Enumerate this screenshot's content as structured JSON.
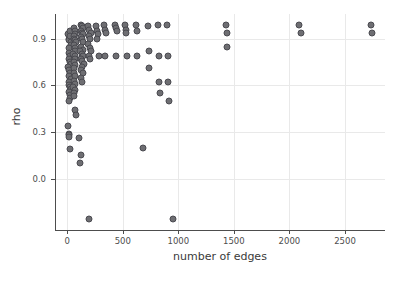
{
  "chart_data": {
    "type": "scatter",
    "title": "",
    "xlabel": "number of edges",
    "ylabel": "rho",
    "xlim": [
      -110,
      2860
    ],
    "ylim": [
      -0.33,
      1.06
    ],
    "xticks": [
      0,
      500,
      1000,
      1500,
      2000,
      2500
    ],
    "xticklabels": [
      "0",
      "500",
      "1000",
      "1500",
      "2000",
      "2500"
    ],
    "yticks": [
      0.0,
      0.3,
      0.6,
      0.9
    ],
    "yticklabels": [
      "0.0",
      "0.3",
      "0.6",
      "0.9"
    ],
    "grid": true,
    "legend": null,
    "marker": {
      "shape": "circle",
      "fill_color": "#6e6e72",
      "edge_color": "#4a4a50",
      "size_px": 7
    },
    "points": [
      {
        "x": 8,
        "y": 0.93
      },
      {
        "x": 12,
        "y": 0.9
      },
      {
        "x": 18,
        "y": 0.89
      },
      {
        "x": 22,
        "y": 0.95
      },
      {
        "x": 26,
        "y": 0.92
      },
      {
        "x": 30,
        "y": 0.88
      },
      {
        "x": 34,
        "y": 0.86
      },
      {
        "x": 16,
        "y": 0.84
      },
      {
        "x": 20,
        "y": 0.81
      },
      {
        "x": 28,
        "y": 0.79
      },
      {
        "x": 14,
        "y": 0.77
      },
      {
        "x": 24,
        "y": 0.75
      },
      {
        "x": 32,
        "y": 0.74
      },
      {
        "x": 10,
        "y": 0.72
      },
      {
        "x": 18,
        "y": 0.7
      },
      {
        "x": 26,
        "y": 0.68
      },
      {
        "x": 12,
        "y": 0.66
      },
      {
        "x": 30,
        "y": 0.64
      },
      {
        "x": 20,
        "y": 0.62
      },
      {
        "x": 14,
        "y": 0.6
      },
      {
        "x": 24,
        "y": 0.59
      },
      {
        "x": 34,
        "y": 0.58
      },
      {
        "x": 18,
        "y": 0.56
      },
      {
        "x": 28,
        "y": 0.54
      },
      {
        "x": 22,
        "y": 0.52
      },
      {
        "x": 16,
        "y": 0.5
      },
      {
        "x": 10,
        "y": 0.34
      },
      {
        "x": 14,
        "y": 0.29
      },
      {
        "x": 18,
        "y": 0.28
      },
      {
        "x": 20,
        "y": 0.27
      },
      {
        "x": 24,
        "y": 0.19
      },
      {
        "x": 60,
        "y": 0.97
      },
      {
        "x": 66,
        "y": 0.95
      },
      {
        "x": 72,
        "y": 0.93
      },
      {
        "x": 58,
        "y": 0.92
      },
      {
        "x": 64,
        "y": 0.9
      },
      {
        "x": 70,
        "y": 0.89
      },
      {
        "x": 76,
        "y": 0.88
      },
      {
        "x": 62,
        "y": 0.86
      },
      {
        "x": 68,
        "y": 0.84
      },
      {
        "x": 74,
        "y": 0.82
      },
      {
        "x": 56,
        "y": 0.8
      },
      {
        "x": 66,
        "y": 0.79
      },
      {
        "x": 72,
        "y": 0.77
      },
      {
        "x": 60,
        "y": 0.75
      },
      {
        "x": 70,
        "y": 0.73
      },
      {
        "x": 64,
        "y": 0.71
      },
      {
        "x": 58,
        "y": 0.68
      },
      {
        "x": 74,
        "y": 0.66
      },
      {
        "x": 62,
        "y": 0.63
      },
      {
        "x": 68,
        "y": 0.61
      },
      {
        "x": 56,
        "y": 0.59
      },
      {
        "x": 72,
        "y": 0.57
      },
      {
        "x": 64,
        "y": 0.55
      },
      {
        "x": 60,
        "y": 0.53
      },
      {
        "x": 70,
        "y": 0.44
      },
      {
        "x": 78,
        "y": 0.41
      },
      {
        "x": 120,
        "y": 0.99
      },
      {
        "x": 130,
        "y": 0.98
      },
      {
        "x": 140,
        "y": 0.97
      },
      {
        "x": 126,
        "y": 0.95
      },
      {
        "x": 136,
        "y": 0.94
      },
      {
        "x": 146,
        "y": 0.93
      },
      {
        "x": 122,
        "y": 0.91
      },
      {
        "x": 134,
        "y": 0.9
      },
      {
        "x": 144,
        "y": 0.88
      },
      {
        "x": 128,
        "y": 0.85
      },
      {
        "x": 138,
        "y": 0.83
      },
      {
        "x": 118,
        "y": 0.82
      },
      {
        "x": 132,
        "y": 0.8
      },
      {
        "x": 142,
        "y": 0.79
      },
      {
        "x": 124,
        "y": 0.77
      },
      {
        "x": 136,
        "y": 0.76
      },
      {
        "x": 148,
        "y": 0.74
      },
      {
        "x": 130,
        "y": 0.72
      },
      {
        "x": 120,
        "y": 0.7
      },
      {
        "x": 140,
        "y": 0.68
      },
      {
        "x": 126,
        "y": 0.65
      },
      {
        "x": 134,
        "y": 0.62
      },
      {
        "x": 190,
        "y": 0.98
      },
      {
        "x": 200,
        "y": 0.96
      },
      {
        "x": 210,
        "y": 0.94
      },
      {
        "x": 196,
        "y": 0.92
      },
      {
        "x": 206,
        "y": 0.9
      },
      {
        "x": 186,
        "y": 0.87
      },
      {
        "x": 202,
        "y": 0.84
      },
      {
        "x": 212,
        "y": 0.82
      },
      {
        "x": 192,
        "y": 0.79
      },
      {
        "x": 208,
        "y": 0.77
      },
      {
        "x": 110,
        "y": 0.26
      },
      {
        "x": 120,
        "y": 0.15
      },
      {
        "x": 116,
        "y": 0.1
      },
      {
        "x": 200,
        "y": -0.26
      },
      {
        "x": 260,
        "y": 0.98
      },
      {
        "x": 270,
        "y": 0.95
      },
      {
        "x": 278,
        "y": 0.93
      },
      {
        "x": 264,
        "y": 0.9
      },
      {
        "x": 282,
        "y": 0.79
      },
      {
        "x": 330,
        "y": 0.99
      },
      {
        "x": 340,
        "y": 0.96
      },
      {
        "x": 346,
        "y": 0.94
      },
      {
        "x": 336,
        "y": 0.79
      },
      {
        "x": 430,
        "y": 0.99
      },
      {
        "x": 440,
        "y": 0.97
      },
      {
        "x": 450,
        "y": 0.95
      },
      {
        "x": 436,
        "y": 0.79
      },
      {
        "x": 520,
        "y": 0.99
      },
      {
        "x": 530,
        "y": 0.96
      },
      {
        "x": 525,
        "y": 0.94
      },
      {
        "x": 535,
        "y": 0.79
      },
      {
        "x": 620,
        "y": 0.99
      },
      {
        "x": 630,
        "y": 0.95
      },
      {
        "x": 625,
        "y": 0.79
      },
      {
        "x": 680,
        "y": 0.2
      },
      {
        "x": 730,
        "y": 0.98
      },
      {
        "x": 740,
        "y": 0.82
      },
      {
        "x": 735,
        "y": 0.71
      },
      {
        "x": 820,
        "y": 0.99
      },
      {
        "x": 830,
        "y": 0.79
      },
      {
        "x": 826,
        "y": 0.62
      },
      {
        "x": 836,
        "y": 0.55
      },
      {
        "x": 900,
        "y": 0.99
      },
      {
        "x": 910,
        "y": 0.79
      },
      {
        "x": 905,
        "y": 0.62
      },
      {
        "x": 915,
        "y": 0.5
      },
      {
        "x": 950,
        "y": -0.26
      },
      {
        "x": 1430,
        "y": 0.99
      },
      {
        "x": 1440,
        "y": 0.94
      },
      {
        "x": 1435,
        "y": 0.85
      },
      {
        "x": 2090,
        "y": 0.99
      },
      {
        "x": 2100,
        "y": 0.94
      },
      {
        "x": 2730,
        "y": 0.99
      },
      {
        "x": 2740,
        "y": 0.94
      }
    ]
  }
}
